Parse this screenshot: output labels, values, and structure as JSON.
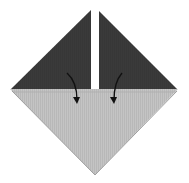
{
  "diagram": {
    "colors": {
      "background": "#ffffff",
      "dark_paper": "#3a3a3a",
      "light_paper": "#c4c4c4",
      "light_paper_edge": "#a8a8a8",
      "arrow": "#111111",
      "gap": "#ffffff"
    },
    "shapes": {
      "left_flap": "11,89 91,10 91,89",
      "right_flap": "99,11 99,89 177,89",
      "bottom_square": "10,89 178,89 95,175",
      "bottom_edge_line": "13,92 176,92"
    },
    "arrows": [
      {
        "name": "left-fold-arrow",
        "path": "M67,73 C75,80 77,90 77,100",
        "tip": "73,97 77,104 80,97"
      },
      {
        "name": "right-fold-arrow",
        "path": "M122,73 C116,80 114,90 114,100",
        "tip": "110,97 114,104 117,97"
      }
    ]
  }
}
